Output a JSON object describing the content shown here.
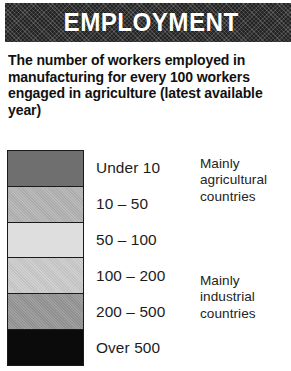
{
  "header": {
    "title": "EMPLOYMENT",
    "background_color": "#242424",
    "text_color": "#ffffff"
  },
  "description": "The number of workers employed in manufacturing for every 100 workers engaged in agriculture (latest available year)",
  "legend": {
    "entries": [
      {
        "label": "Under 10",
        "color": "#6f6f6f",
        "range_min": 0,
        "range_max": 10
      },
      {
        "label": "10 – 50",
        "color": "#b3b3b3",
        "range_min": 10,
        "range_max": 50
      },
      {
        "label": "50 – 100",
        "color": "#dedede",
        "range_min": 50,
        "range_max": 100
      },
      {
        "label": "100 – 200",
        "color": "#cbcbcb",
        "range_min": 100,
        "range_max": 200
      },
      {
        "label": "200 – 500",
        "color": "#959595",
        "range_min": 200,
        "range_max": 500
      },
      {
        "label": "Over 500",
        "color": "#0b0b0b",
        "range_min": 500,
        "range_max": null
      }
    ],
    "groups": [
      {
        "id": "agricultural",
        "text": "Mainly agricultural countries",
        "covers": [
          "Under 10",
          "10 – 50",
          "50 – 100"
        ]
      },
      {
        "id": "industrial",
        "text": "Mainly industrial countries",
        "covers": [
          "100 – 200",
          "200 – 500",
          "Over 500"
        ]
      }
    ]
  },
  "chart_data": {
    "type": "table",
    "title": "EMPLOYMENT",
    "subtitle": "The number of workers employed in manufacturing for every 100 workers engaged in agriculture (latest available year)",
    "categories": [
      "Under 10",
      "10 – 50",
      "50 – 100",
      "100 – 200",
      "200 – 500",
      "Over 500"
    ],
    "values": [
      null,
      null,
      null,
      null,
      null,
      null
    ],
    "colors": [
      "#6f6f6f",
      "#b3b3b3",
      "#dedede",
      "#cbcbcb",
      "#959595",
      "#0b0b0b"
    ],
    "annotations": [
      "Mainly agricultural countries",
      "Mainly industrial countries"
    ],
    "xlabel": "",
    "ylabel": "Manufacturing workers per 100 agricultural workers",
    "legend_position": "full-figure"
  }
}
